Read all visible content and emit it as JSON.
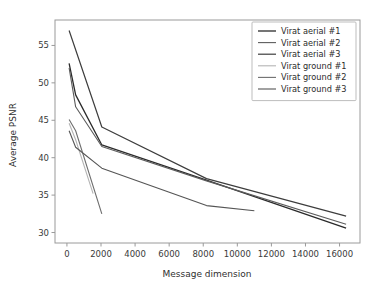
{
  "chart_data": {
    "type": "line",
    "title": "",
    "xlabel": "Message dimension",
    "ylabel": "Average PSNR",
    "xlim": [
      -700,
      17200
    ],
    "ylim": [
      28.6,
      58.4
    ],
    "xticks": [
      0,
      2000,
      4000,
      6000,
      8000,
      10000,
      12000,
      14000,
      16000
    ],
    "xtick_labels": [
      "0",
      "2000",
      "4000",
      "6000",
      "8000",
      "10000",
      "12000",
      "14000",
      "16000"
    ],
    "yticks": [
      30,
      35,
      40,
      45,
      50,
      55
    ],
    "ytick_labels": [
      "30",
      "35",
      "40",
      "45",
      "50",
      "55"
    ],
    "grid": false,
    "legend_position": "upper right",
    "series": [
      {
        "name": "Virat aerial #1",
        "color": "#2a2a2a",
        "linewidth": 1.3,
        "x": [
          128,
          512,
          2048,
          8192,
          16384
        ],
        "y": [
          52.6,
          48.4,
          41.7,
          37.0,
          30.6
        ]
      },
      {
        "name": "Virat aerial #2",
        "color": "#5c5c5c",
        "linewidth": 1.1,
        "x": [
          128,
          512,
          2048,
          8192,
          16384
        ],
        "y": [
          52.0,
          46.8,
          41.5,
          36.9,
          31.1
        ]
      },
      {
        "name": "Virat aerial #3",
        "color": "#3d3d3d",
        "linewidth": 1.2,
        "x": [
          128,
          2048,
          8192,
          16384
        ],
        "y": [
          57.0,
          44.1,
          37.2,
          32.2
        ]
      },
      {
        "name": "Virat ground #1",
        "color": "#b4b4b4",
        "linewidth": 1.1,
        "x": [
          128,
          512,
          1536
        ],
        "y": [
          44.6,
          42.4,
          35.2
        ]
      },
      {
        "name": "Virat ground #2",
        "color": "#6e6e6e",
        "linewidth": 1.1,
        "x": [
          128,
          512,
          2048
        ],
        "y": [
          45.1,
          43.6,
          32.5
        ]
      },
      {
        "name": "Virat ground #3",
        "color": "#555555",
        "linewidth": 1.1,
        "x": [
          128,
          512,
          2048,
          8192,
          11000
        ],
        "y": [
          43.6,
          41.4,
          38.6,
          33.6,
          32.9
        ]
      }
    ]
  },
  "legend": {
    "entries": [
      {
        "label": "Virat aerial #1"
      },
      {
        "label": "Virat aerial #2"
      },
      {
        "label": "Virat aerial #3"
      },
      {
        "label": "Virat ground #1"
      },
      {
        "label": "Virat ground #2"
      },
      {
        "label": "Virat ground #3"
      }
    ]
  },
  "axes": {
    "x_title": "Message dimension",
    "y_title": "Average PSNR"
  }
}
